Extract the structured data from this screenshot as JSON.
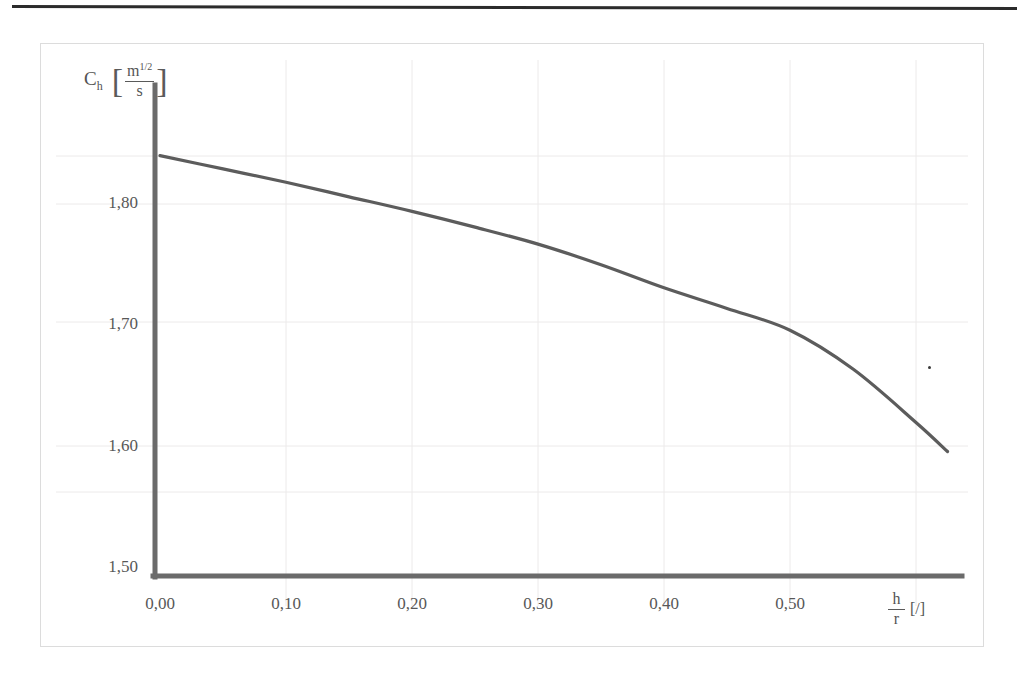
{
  "figure": {
    "frame": {
      "x": 40,
      "y": 43,
      "width": 944,
      "height": 604
    }
  },
  "chart_data": {
    "type": "line",
    "title": "",
    "subtitle": "",
    "xlabel": "h/r [/]",
    "ylabel": "C_h [m^1/2 / s]",
    "ylabel_symbol": "C",
    "ylabel_subscript": "h",
    "ylabel_unit_numerator": "m",
    "ylabel_unit_numerator_exponent": "1/2",
    "ylabel_unit_denominator": "s",
    "xlabel_numerator": "h",
    "xlabel_denominator": "r",
    "xlabel_unit": "[/]",
    "grid": "faint",
    "legend": "none",
    "xlim": [
      0.0,
      0.625
    ],
    "ylim": [
      1.5,
      1.85
    ],
    "xticks": [
      "0,00",
      "0,10",
      "0,20",
      "0,30",
      "0,40",
      "0,50"
    ],
    "xtick_values": [
      0.0,
      0.1,
      0.2,
      0.3,
      0.4,
      0.5
    ],
    "yticks": [
      "1,50",
      "1,60",
      "1,70",
      "1,80"
    ],
    "ytick_values": [
      1.5,
      1.6,
      1.7,
      1.8
    ],
    "series": [
      {
        "name": "Ch",
        "color": "#5c5c5c",
        "x": [
          0.0,
          0.05,
          0.1,
          0.15,
          0.2,
          0.25,
          0.3,
          0.35,
          0.4,
          0.45,
          0.5,
          0.55,
          0.6,
          0.625
        ],
        "y": [
          1.84,
          1.829,
          1.818,
          1.806,
          1.794,
          1.781,
          1.767,
          1.75,
          1.731,
          1.714,
          1.696,
          1.664,
          1.62,
          1.596
        ]
      }
    ],
    "annotations": []
  },
  "axes": {
    "axis_color": "#6b6b6b",
    "curve_color": "#5c5c5c",
    "frame_color": "#dcdcdc",
    "text_color": "#585858"
  }
}
